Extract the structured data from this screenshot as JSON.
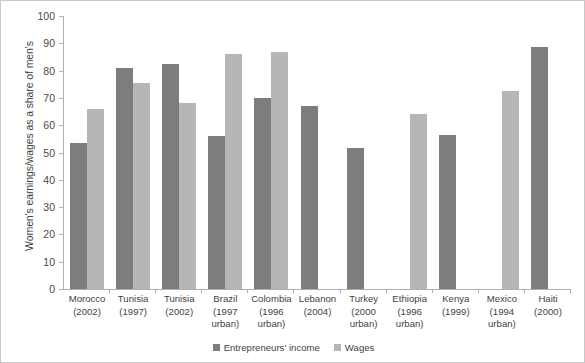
{
  "chart_data": {
    "type": "bar",
    "title": "",
    "xlabel": "",
    "ylabel": "Women's earnings/wages as a share of men's",
    "ylim": [
      0,
      100
    ],
    "yticks": [
      0,
      10,
      20,
      30,
      40,
      50,
      60,
      70,
      80,
      90,
      100
    ],
    "grid": false,
    "legend_position": "bottom-center",
    "categories": [
      "Morocco (2002)",
      "Tunisia (1997)",
      "Tunisia (2002)",
      "Brazil (1997 urban)",
      "Colombia (1996 urban)",
      "Lebanon (2004)",
      "Turkey (2000 urban)",
      "Ethiopia (1996 urban)",
      "Kenya (1999)",
      "Mexico (1994 urban)",
      "Haiti (2000)"
    ],
    "category_lines": [
      [
        "Morocco",
        "(2002)"
      ],
      [
        "Tunisia",
        "(1997)"
      ],
      [
        "Tunisia",
        "(2002)"
      ],
      [
        "Brazil",
        "(1997",
        "urban)"
      ],
      [
        "Colombia",
        "(1996",
        "urban)"
      ],
      [
        "Lebanon",
        "(2004)"
      ],
      [
        "Turkey",
        "(2000",
        "urban)"
      ],
      [
        "Ethiopia",
        "(1996",
        "urban)"
      ],
      [
        "Kenya",
        "(1999)"
      ],
      [
        "Mexico",
        "(1994",
        "urban)"
      ],
      [
        "Haiti",
        "(2000)"
      ]
    ],
    "series": [
      {
        "name": "Entrepreneurs' income",
        "color": "#7d7d7d",
        "values": [
          53.5,
          81,
          82.5,
          56,
          70,
          67,
          51.5,
          null,
          56.5,
          null,
          88.5
        ]
      },
      {
        "name": "Wages",
        "color": "#b6b6b6",
        "values": [
          66,
          75.5,
          68,
          86,
          87,
          null,
          null,
          64,
          null,
          72.5,
          null
        ]
      }
    ]
  },
  "legend": {
    "items": [
      {
        "label": "Entrepreneurs' income",
        "color": "#7d7d7d"
      },
      {
        "label": "Wages",
        "color": "#b6b6b6"
      }
    ]
  },
  "axis": {
    "y_title": "Women's earnings/wages as a share of men's",
    "y_tick_labels": [
      "100",
      "90",
      "80",
      "70",
      "60",
      "50",
      "40",
      "30",
      "20",
      "10",
      "0"
    ]
  }
}
